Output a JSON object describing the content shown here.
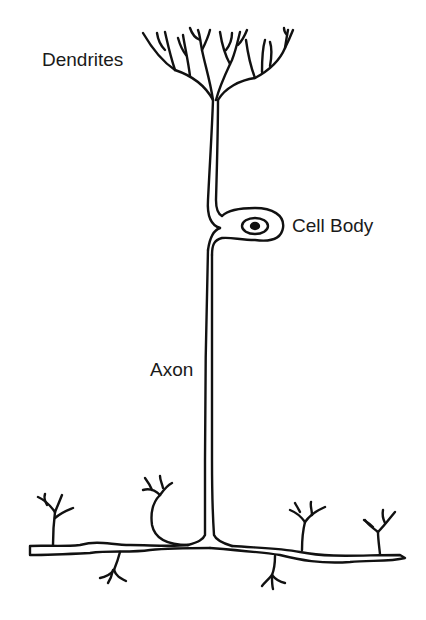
{
  "diagram": {
    "labels": {
      "dendrites": "Dendrites",
      "cell_body": "Cell Body",
      "axon": "Axon"
    },
    "parts": [
      "dendrites",
      "cell-body",
      "nucleus",
      "axon",
      "axon-terminals"
    ],
    "colors": {
      "line": "#111111",
      "background": "#ffffff",
      "text": "#1a1a1a"
    }
  }
}
